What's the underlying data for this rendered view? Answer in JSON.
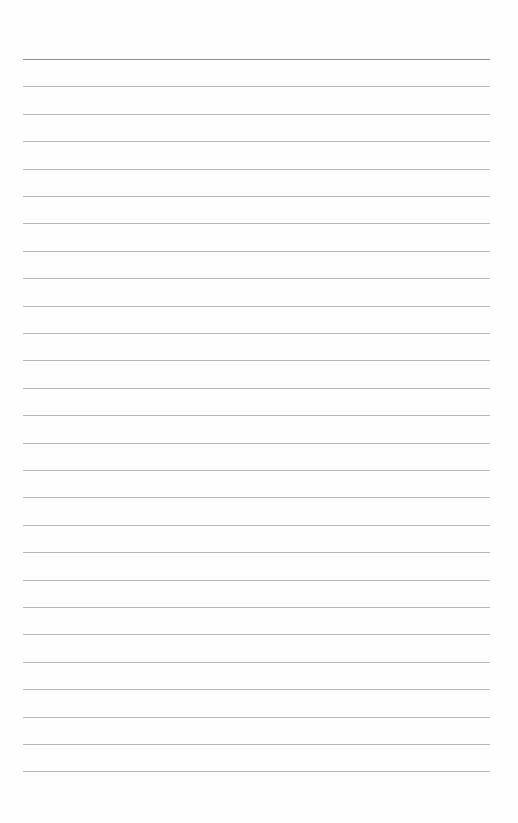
{
  "page": {
    "type": "lined-paper",
    "line_count": 27,
    "first_line_y": 59,
    "line_spacing": 27.4,
    "line_left": 23,
    "line_width": 467,
    "colors": {
      "background": "#fefefe",
      "rule": "#b9b9b9",
      "top_rule": "#8e8e8e"
    }
  }
}
